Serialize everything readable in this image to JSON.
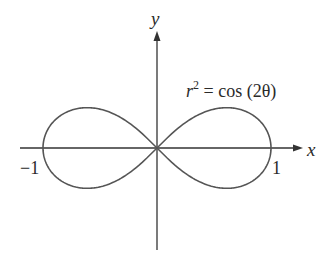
{
  "figure": {
    "equation_label": {
      "r": "r",
      "sup": "2",
      "rest": " = cos (2θ)"
    },
    "x_axis_label": "x",
    "y_axis_label": "y",
    "tick_left": "−1",
    "tick_right": "1",
    "colors": {
      "curve": "#555555",
      "axis": "#333333",
      "background": "#ffffff"
    }
  },
  "chart_data": {
    "type": "line",
    "equation": "r^2 = cos(2θ)",
    "xlabel": "x",
    "ylabel": "y",
    "xlim": [
      -1.2,
      1.2
    ],
    "ticks": {
      "x": [
        -1,
        1
      ]
    },
    "key_points": [
      {
        "x": -1,
        "y": 0
      },
      {
        "x": 0,
        "y": 0
      },
      {
        "x": 1,
        "y": 0
      },
      {
        "x": 0.612,
        "y": 0.354
      },
      {
        "x": 0.612,
        "y": -0.354
      },
      {
        "x": -0.612,
        "y": 0.354
      },
      {
        "x": -0.612,
        "y": -0.354
      }
    ],
    "grid": false,
    "legend": "none"
  }
}
